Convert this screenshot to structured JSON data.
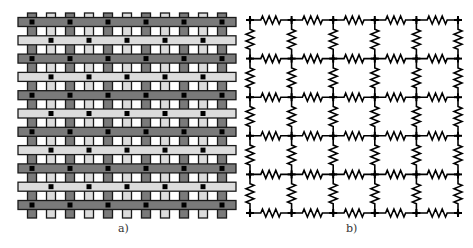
{
  "figure": {
    "panels": [
      {
        "id": "a",
        "label": "a)",
        "description": "woven strip lattice"
      },
      {
        "id": "b",
        "label": "b)",
        "description": "resistor network grid"
      }
    ]
  },
  "panel_a": {
    "label": "a)",
    "vertical_strips": 11,
    "horizontal_strips": 11,
    "colors": {
      "dark": "#7a7a7a",
      "light": "#dcdcdc",
      "outline": "#1a1a1a",
      "dot": "#000000"
    }
  },
  "panel_b": {
    "label": "b)",
    "node_columns": 6,
    "node_rows": 6,
    "colors": {
      "wire": "#000000"
    }
  }
}
